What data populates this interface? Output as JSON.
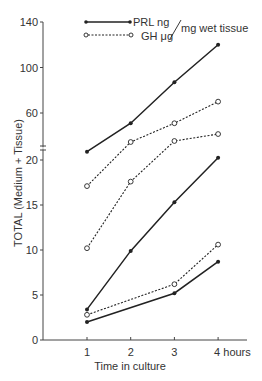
{
  "chart_data": {
    "type": "line",
    "title": "",
    "xlabel": "Time in culture",
    "ylabel": "TOTAL (Medium + Tissue)",
    "x": [
      1,
      2,
      3,
      4
    ],
    "x_tick_labels": [
      "1",
      "2",
      "3",
      "4 hours"
    ],
    "y_axis_broken": true,
    "y_break_between": [
      20,
      60
    ],
    "y_ticks_lower": [
      0,
      5,
      10,
      15,
      20
    ],
    "y_ticks_upper": [
      60,
      100,
      140
    ],
    "ylim": [
      0,
      140
    ],
    "grid": false,
    "legend_position": "top",
    "legend": [
      {
        "label": "PRL ng",
        "style": "solid",
        "marker": "filled-circle",
        "color": "#222222"
      },
      {
        "label": "GH μg",
        "style": "dashed",
        "marker": "open-circle",
        "color": "#222222"
      }
    ],
    "legend_unit_suffix": "mg wet tissue",
    "series": [
      {
        "name": "PRL ng (high)",
        "kind": "PRL",
        "values": [
          26,
          51,
          87,
          120
        ]
      },
      {
        "name": "GH μg (high)",
        "kind": "GH",
        "values": [
          17.1,
          34.5,
          51,
          70
        ]
      },
      {
        "name": "GH μg (mid)",
        "kind": "GH",
        "values": [
          10.2,
          17.6,
          35.4,
          41.5
        ]
      },
      {
        "name": "PRL ng (mid)",
        "kind": "PRL",
        "values": [
          3.4,
          9.9,
          15.3,
          20.6
        ]
      },
      {
        "name": "GH μg (low)",
        "kind": "GH",
        "values": [
          2.8,
          null,
          6.2,
          10.6
        ]
      },
      {
        "name": "PRL ng (low)",
        "kind": "PRL",
        "values": [
          2.0,
          null,
          5.2,
          8.7
        ]
      }
    ]
  },
  "labels": {
    "legend_prl": "PRL ng",
    "legend_gh": "GH μg",
    "legend_unit": "mg wet tissue",
    "xlabel": "Time in culture",
    "ylabel": "TOTAL (Medium + Tissue)"
  }
}
